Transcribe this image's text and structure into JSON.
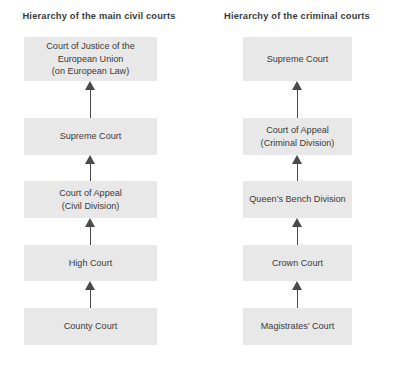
{
  "diagram": {
    "type": "flowchart-hierarchy",
    "columns": [
      {
        "key": "civil",
        "title": "Hierarchy of the main civil courts",
        "nodes": [
          {
            "lines": [
              "Court of Justice of the",
              "European Union",
              "(on European Law)"
            ]
          },
          {
            "lines": [
              "Supreme Court"
            ]
          },
          {
            "lines": [
              "Court of Appeal",
              "(Civil Division)"
            ]
          },
          {
            "lines": [
              "High Court"
            ]
          },
          {
            "lines": [
              "County Court"
            ]
          }
        ]
      },
      {
        "key": "criminal",
        "title": "Hierarchy of the criminal courts",
        "nodes": [
          {
            "lines": [
              "Supreme Court"
            ]
          },
          {
            "lines": [
              "Court of Appeal",
              "(Criminal Division)"
            ]
          },
          {
            "lines": [
              "Queen’s Bench Division"
            ]
          },
          {
            "lines": [
              "Crown Court"
            ]
          },
          {
            "lines": [
              "Magistrates’ Court"
            ]
          }
        ]
      }
    ],
    "arrow_direction": "upward",
    "colors": {
      "box_fill": "#e8e8e8",
      "text": "#3a3a3a",
      "title_text": "#3b3b3b",
      "arrow": "#4a4a4a",
      "background": "#ffffff"
    }
  }
}
